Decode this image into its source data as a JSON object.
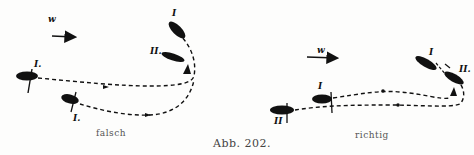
{
  "figure": {
    "caption": "Abb. 202.",
    "panels": [
      {
        "id": "left",
        "label": "falsch",
        "wind_label": "w",
        "boat_labels": [
          "I",
          "II.",
          "I.",
          "I."
        ]
      },
      {
        "id": "right",
        "label": "richtig",
        "wind_label": "w",
        "boat_labels": [
          "I",
          "II.",
          "I",
          "II"
        ]
      }
    ]
  },
  "colors": {
    "ink": "#111111",
    "paper": "#fdfdfc"
  }
}
